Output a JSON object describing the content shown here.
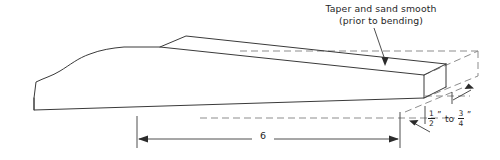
{
  "drawing": {
    "title": "Tapered plank woodworking detail",
    "background_color": "#ffffff",
    "line_color": "#3a3a3a",
    "hidden_line_color": "#8d8d8d",
    "text_color": "#1f1f1f"
  },
  "annotations": {
    "callout": {
      "line1": "Taper and sand smooth",
      "line2": "(prior to bending)"
    }
  },
  "dimensions": {
    "length": {
      "value": "6",
      "unit": "",
      "label": "6"
    },
    "thickness": {
      "min_numerator": "1",
      "min_denominator": "2",
      "connector": "to",
      "max_numerator": "3",
      "max_denominator": "4",
      "inch_mark": "”"
    }
  }
}
